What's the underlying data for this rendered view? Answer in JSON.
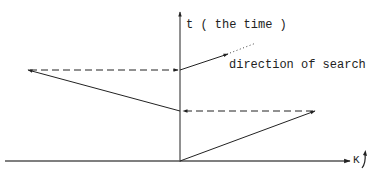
{
  "diagram": {
    "axes": {
      "vertical_label": "t ( the time )",
      "horizontal_label": "K"
    },
    "annotations": {
      "direction": "direction of search"
    },
    "colors": {
      "stroke": "#222222",
      "background": "#ffffff"
    },
    "elements": [
      {
        "type": "axis",
        "name": "t-axis",
        "from": [
          180,
          162
        ],
        "to": [
          180,
          12
        ],
        "arrow": "end"
      },
      {
        "type": "axis",
        "name": "k-axis",
        "from": [
          5,
          161
        ],
        "to": [
          350,
          161
        ],
        "arrow": "end"
      },
      {
        "type": "solid-arrow",
        "name": "search-step-1",
        "from": [
          180,
          161
        ],
        "to": [
          315,
          111
        ]
      },
      {
        "type": "dashed-arrow",
        "name": "projection-1",
        "from": [
          315,
          111
        ],
        "to": [
          182,
          111
        ]
      },
      {
        "type": "solid-line",
        "name": "search-step-2",
        "from": [
          180,
          111
        ],
        "to": [
          27,
          70
        ]
      },
      {
        "type": "dashed-arrow",
        "name": "projection-2",
        "from": [
          27,
          70
        ],
        "to": [
          178,
          70
        ]
      },
      {
        "type": "solid-arrow",
        "name": "search-step-3",
        "from": [
          180,
          70
        ],
        "to": [
          228,
          54
        ]
      },
      {
        "type": "dotted-line",
        "name": "search-continuation",
        "from": [
          228,
          54
        ],
        "to": [
          256,
          43
        ]
      }
    ]
  }
}
